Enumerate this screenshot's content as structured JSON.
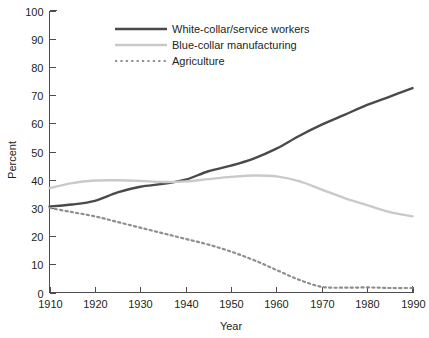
{
  "chart_data": {
    "type": "line",
    "title": "",
    "xlabel": "Year",
    "ylabel": "Percent",
    "xlim": [
      1910,
      1990
    ],
    "ylim": [
      0,
      100
    ],
    "grid": false,
    "legend_position": "top-center",
    "xticks": [
      "1910",
      "1920",
      "1930",
      "1940",
      "1950",
      "1960",
      "1970",
      "1980",
      "1990"
    ],
    "yticks": [
      "0",
      "10",
      "20",
      "30",
      "40",
      "50",
      "60",
      "70",
      "80",
      "90",
      "100"
    ],
    "x": [
      1910,
      1915,
      1920,
      1925,
      1930,
      1935,
      1940,
      1945,
      1950,
      1955,
      1960,
      1965,
      1970,
      1975,
      1980,
      1985,
      1990
    ],
    "series": [
      {
        "name": "White-collar/service workers",
        "color": "#4a4a4a",
        "style": "solid",
        "values": [
          30.5,
          31.2,
          32.5,
          35.5,
          37.5,
          38.5,
          40.0,
          43.0,
          45.0,
          47.5,
          51.0,
          55.5,
          59.5,
          63.0,
          66.5,
          69.5,
          72.5
        ]
      },
      {
        "name": "Blue-collar manufacturing",
        "color": "#c9c9c9",
        "style": "solid",
        "values": [
          37.0,
          38.8,
          39.7,
          39.8,
          39.6,
          39.2,
          39.4,
          40.2,
          41.0,
          41.5,
          41.2,
          39.5,
          36.5,
          33.5,
          31.0,
          28.5,
          27.0
        ]
      },
      {
        "name": "Agriculture",
        "color": "#8f8f8f",
        "style": "dotted",
        "values": [
          30.0,
          28.5,
          27.0,
          25.0,
          23.0,
          21.0,
          19.0,
          17.0,
          14.5,
          11.5,
          8.0,
          4.5,
          2.0,
          1.7,
          1.8,
          1.6,
          1.6
        ]
      }
    ]
  },
  "legend": {
    "items": [
      {
        "label": "White-collar/service workers"
      },
      {
        "label": "Blue-collar manufacturing"
      },
      {
        "label": "Agriculture"
      }
    ]
  },
  "axes": {
    "x_title": "Year",
    "y_title": "Percent"
  }
}
